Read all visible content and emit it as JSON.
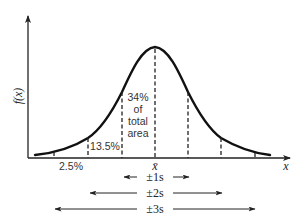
{
  "diagram": {
    "axes": {
      "y_label": "f(x)",
      "x_label": "x"
    },
    "center_label": "x̄",
    "area_labels": {
      "center_line1": "34%",
      "center_line2": "of",
      "center_line3": "total",
      "center_line4": "area",
      "second_band": "13.5%",
      "third_band": "2.5%"
    },
    "ranges": [
      {
        "label": "±1s",
        "sigma": 1
      },
      {
        "label": "±2s",
        "sigma": 2
      },
      {
        "label": "±3s",
        "sigma": 3
      }
    ],
    "colors": {
      "curve": "#111111",
      "axis": "#222222",
      "dashed": "#222222",
      "text": "#333333"
    }
  }
}
